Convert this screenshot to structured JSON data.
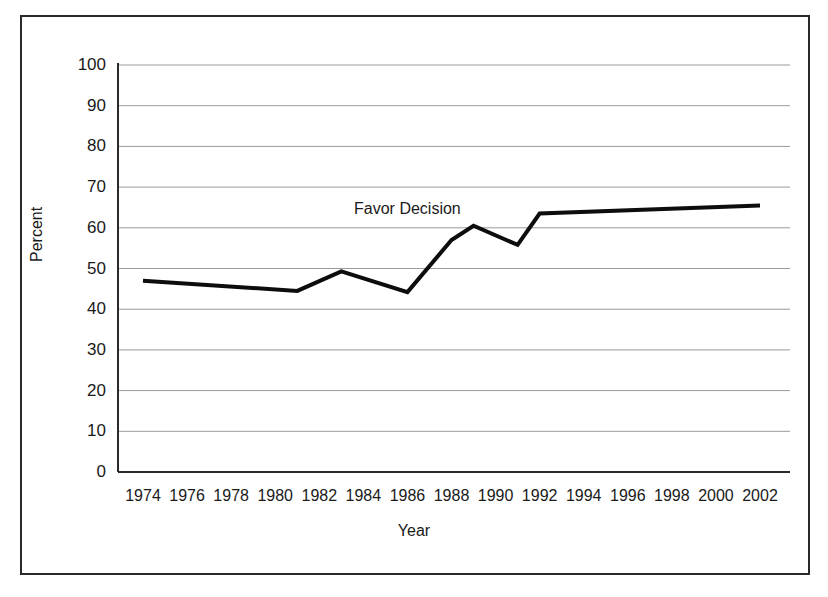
{
  "chart_data": {
    "type": "line",
    "title": "",
    "subtitle": "",
    "xlabel": "Year",
    "ylabel": "Percent",
    "xlim": [
      1974,
      2002
    ],
    "ylim": [
      0,
      100
    ],
    "ytick_step": 10,
    "xtick_step": 2,
    "grid": "horizontal",
    "legend_position": "inline-annotation",
    "annotations": [
      {
        "text": "Favor Decision",
        "x": 1986.3,
        "y": 64.5
      }
    ],
    "xticks": [
      "1974",
      "1976",
      "1978",
      "1980",
      "1982",
      "1984",
      "1986",
      "1988",
      "1990",
      "1992",
      "1994",
      "1996",
      "1998",
      "2000",
      "2002"
    ],
    "yticks": [
      "0",
      "10",
      "20",
      "30",
      "40",
      "50",
      "60",
      "70",
      "80",
      "90",
      "100"
    ],
    "series": [
      {
        "name": "Favor Decision",
        "color": "#0d0d0d",
        "line_width": 4,
        "x": [
          1974,
          1981,
          1983,
          1986,
          1988,
          1989,
          1991,
          1992,
          2002
        ],
        "values": [
          47.0,
          44.5,
          49.3,
          44.2,
          57.0,
          60.5,
          55.8,
          63.5,
          65.5
        ]
      }
    ]
  },
  "figure": {
    "border_color": "#2a2a2a",
    "background": "#ffffff",
    "gridline_color": "#9a9a9a",
    "axis_color": "#2a2a2a"
  }
}
